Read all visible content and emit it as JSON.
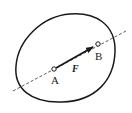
{
  "diagram": {
    "title": "",
    "labels": {
      "point_a": "A",
      "point_b": "B",
      "force": "F"
    },
    "colors": {
      "stroke": "#1a1a1a",
      "background": "#ffffff"
    },
    "elements": [
      "rigid body outline",
      "dashed line of action through A and B",
      "force vector F from A toward B"
    ]
  }
}
